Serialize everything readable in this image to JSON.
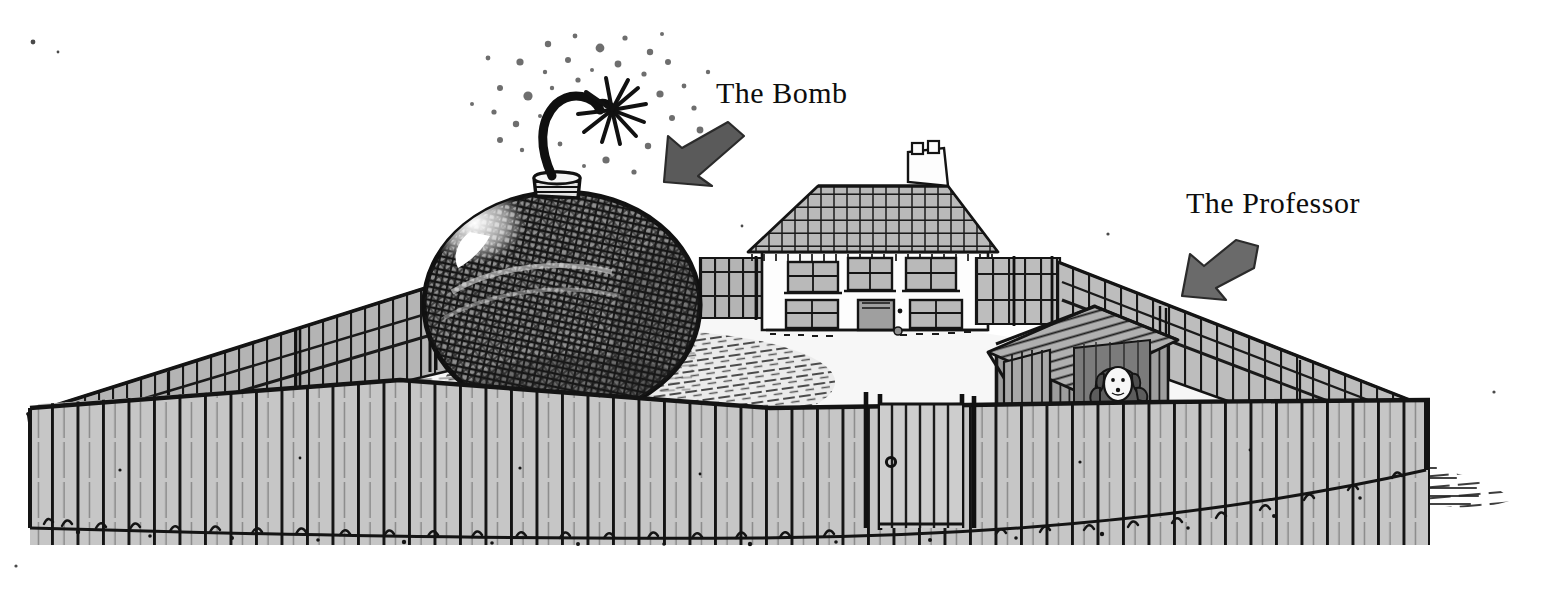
{
  "illustration": {
    "title": "Fenced yard with giant bomb, cottage and doghouse",
    "medium": "pen-and-ink line drawing with gray wash",
    "background_color": "#ffffff",
    "ink_color": "#111111",
    "palette": {
      "ink": "#141414",
      "fence_light": "#c9c9c9",
      "fence_mid": "#b3b3b3",
      "fence_dark": "#9a9a9a",
      "ground_light": "#f2f2f2",
      "shadow_gray": "#a8a8a8",
      "bomb_gray": "#8c8c8c",
      "roof_gray": "#b8b8b8",
      "arrow_gray": "#5e5e5e",
      "wall_white": "#fdfdfd"
    }
  },
  "labels": [
    {
      "id": "bomb",
      "text": "The Bomb",
      "arrow": "arrow-down-left",
      "points_at": "bomb-fuse"
    },
    {
      "id": "professor",
      "text": "The Professor",
      "arrow": "arrow-down-left",
      "points_at": "doghouse-dog"
    }
  ],
  "objects": {
    "bomb": {
      "name": "giant round cartoon bomb",
      "texture": "dense cross-hatched shell",
      "highlight": "white glint on upper left",
      "fuse": "curved lit fuse with spark burst",
      "neck": "short ribbed cylindrical cap"
    },
    "cottage": {
      "name": "small cottage",
      "roof": "shingled pitched roof",
      "chimney_pots": 2,
      "upper_windows": 3,
      "lower_windows": 2,
      "door": 1,
      "walls": "white rendered walls"
    },
    "doghouse": {
      "name": "wooden doghouse",
      "roof": "planked pitched roof",
      "occupant": "dog with raised paws"
    },
    "fence": {
      "name": "picket fence enclosure",
      "front_pickets": 52,
      "gate": 1,
      "gate_latch": "round handle",
      "grass_tufts": "ink tufts along base"
    },
    "ground": {
      "yard": "pale ground inside fence",
      "bomb_shadow": "large hatched ellipse shadow",
      "right_shadow": "horizontal hatch lines outside right corner"
    }
  }
}
